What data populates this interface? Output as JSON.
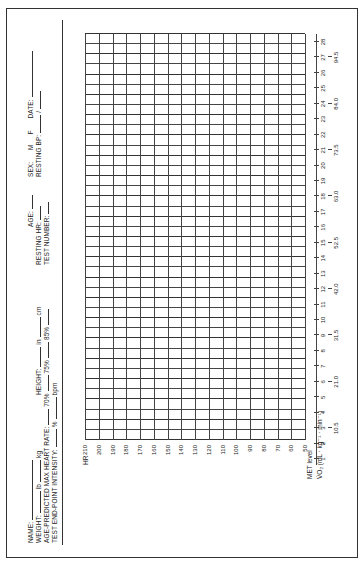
{
  "form": {
    "header": {
      "name_label": "NAME:",
      "weight_label": "WEIGHT:",
      "lb_unit": "lb",
      "kg_unit": "kg",
      "age_predicted_label": "AGE-PREDICTED MAX HEART RATE:",
      "pct70": "70%",
      "test_endpoint_label": "TEST END-POINT INTENSITY:",
      "pct_unit": "%",
      "bpm_unit": "bpm",
      "height_label": "HEIGHT:",
      "in_unit": "in",
      "cm_unit": "cm",
      "pct75": "75%",
      "pct85": "85%",
      "age_label": "AGE:",
      "resting_hr_label": "RESTING HR:",
      "test_number_label": "TEST NUMBER:",
      "sex_label": "SEX:",
      "male": "M",
      "female": "F",
      "date_label": "DATE:",
      "resting_bp_label": "RESTING BP:",
      "bp_sep": "/"
    },
    "hr_axis": {
      "label": "HR",
      "ticks": [
        "210",
        "200",
        "190",
        "180",
        "170",
        "160",
        "150",
        "140",
        "130",
        "120",
        "110",
        "100",
        "90",
        "80",
        "70",
        "60",
        "50"
      ]
    },
    "met_axis": {
      "label": "MET level",
      "ticks": [
        "1",
        "2",
        "3",
        "4",
        "5",
        "6",
        "7",
        "8",
        "9",
        "10",
        "11",
        "12",
        "13",
        "14",
        "15",
        "16",
        "17",
        "18",
        "19",
        "20",
        "21",
        "22",
        "23",
        "24",
        "25",
        "26",
        "27",
        "28"
      ]
    },
    "vo2_axis": {
      "label": "V̇O₂ (mL · kg⁻¹ · min⁻¹)",
      "ticks": [
        {
          "met": 3,
          "value": "10.5"
        },
        {
          "met": 6,
          "value": "21.0"
        },
        {
          "met": 9,
          "value": "31.5"
        },
        {
          "met": 12,
          "value": "42.0"
        },
        {
          "met": 15,
          "value": "52.5"
        },
        {
          "met": 18,
          "value": "63.0"
        },
        {
          "met": 21,
          "value": "73.5"
        },
        {
          "met": 24,
          "value": "84.0"
        },
        {
          "met": 27,
          "value": "94.5"
        }
      ]
    }
  }
}
